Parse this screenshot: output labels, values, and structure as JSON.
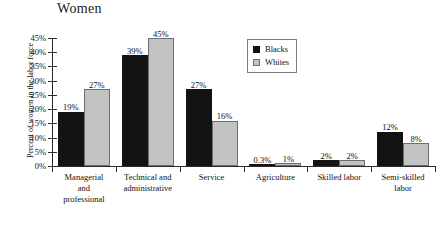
{
  "chart_data": {
    "type": "bar",
    "title": "Women",
    "xlabel": "",
    "ylabel": "Percent of women in the labor force",
    "ylim": [
      0,
      45
    ],
    "ytick_labels": [
      "0%",
      "5%",
      "10%",
      "15%",
      "20%",
      "25%",
      "30%",
      "35%",
      "40%",
      "45%"
    ],
    "ytick_values": [
      0,
      5,
      10,
      15,
      20,
      25,
      30,
      35,
      40,
      45
    ],
    "grid": false,
    "legend_position": "upper-right",
    "categories": [
      "Managerial and professional",
      "Technical and administrative",
      "Service",
      "Agriculture",
      "Skilled labor",
      "Semi-skilled labor"
    ],
    "category_lines": [
      [
        "Managerial",
        "and",
        "professional"
      ],
      [
        "Technical and",
        "administrative"
      ],
      [
        "Service"
      ],
      [
        "Agriculture"
      ],
      [
        "Skilled labor"
      ],
      [
        "Semi-skilled",
        "labor"
      ]
    ],
    "series": [
      {
        "name": "Blacks",
        "color": "#131313",
        "values": [
          19,
          39,
          27,
          0.3,
          2,
          12
        ],
        "labels": [
          "19%",
          "39%",
          "27%",
          "0.3%",
          "2%",
          "12%"
        ]
      },
      {
        "name": "Whites",
        "color": "#c3c3c3",
        "values": [
          27,
          45,
          16,
          1,
          2,
          8
        ],
        "labels": [
          "27%",
          "45%",
          "16%",
          "1%",
          "2%",
          "8%"
        ]
      }
    ]
  },
  "legend": {
    "items": [
      {
        "label": "Blacks",
        "swatch": "blacks"
      },
      {
        "label": "Whites",
        "swatch": "whites"
      }
    ]
  }
}
